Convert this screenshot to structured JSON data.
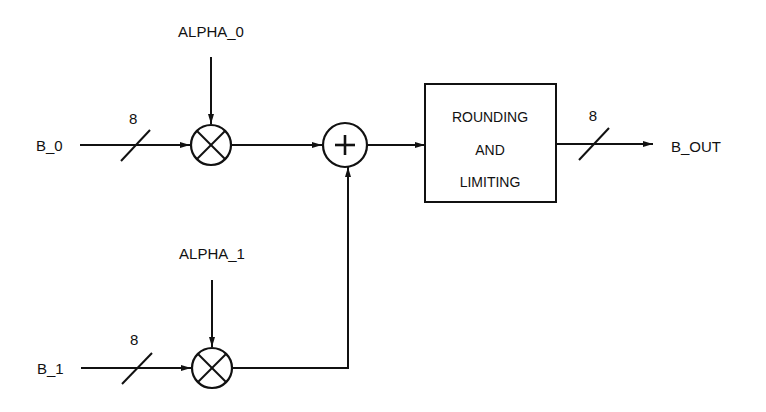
{
  "diagram": {
    "type": "block-diagram",
    "title": "",
    "inputs": {
      "b0": {
        "label": "B_0",
        "width_label": "8"
      },
      "b1": {
        "label": "B_1",
        "width_label": "8"
      },
      "alpha0": {
        "label": "ALPHA_0"
      },
      "alpha1": {
        "label": "ALPHA_1"
      }
    },
    "operators": {
      "mult0": {
        "symbol": "×",
        "kind": "multiplier"
      },
      "mult1": {
        "symbol": "×",
        "kind": "multiplier"
      },
      "adder": {
        "symbol": "+",
        "kind": "adder"
      }
    },
    "block": {
      "line1": "ROUNDING",
      "line2": "AND",
      "line3": "LIMITING"
    },
    "output": {
      "label": "B_OUT",
      "width_label": "8"
    },
    "colors": {
      "stroke": "#111111",
      "background": "#ffffff"
    },
    "edges": [
      {
        "from": "B_0",
        "to": "mult0",
        "bus_width": "8"
      },
      {
        "from": "ALPHA_0",
        "to": "mult0"
      },
      {
        "from": "B_1",
        "to": "mult1",
        "bus_width": "8"
      },
      {
        "from": "ALPHA_1",
        "to": "mult1"
      },
      {
        "from": "mult0",
        "to": "adder"
      },
      {
        "from": "mult1",
        "to": "adder"
      },
      {
        "from": "adder",
        "to": "ROUNDING AND LIMITING"
      },
      {
        "from": "ROUNDING AND LIMITING",
        "to": "B_OUT",
        "bus_width": "8"
      }
    ]
  }
}
